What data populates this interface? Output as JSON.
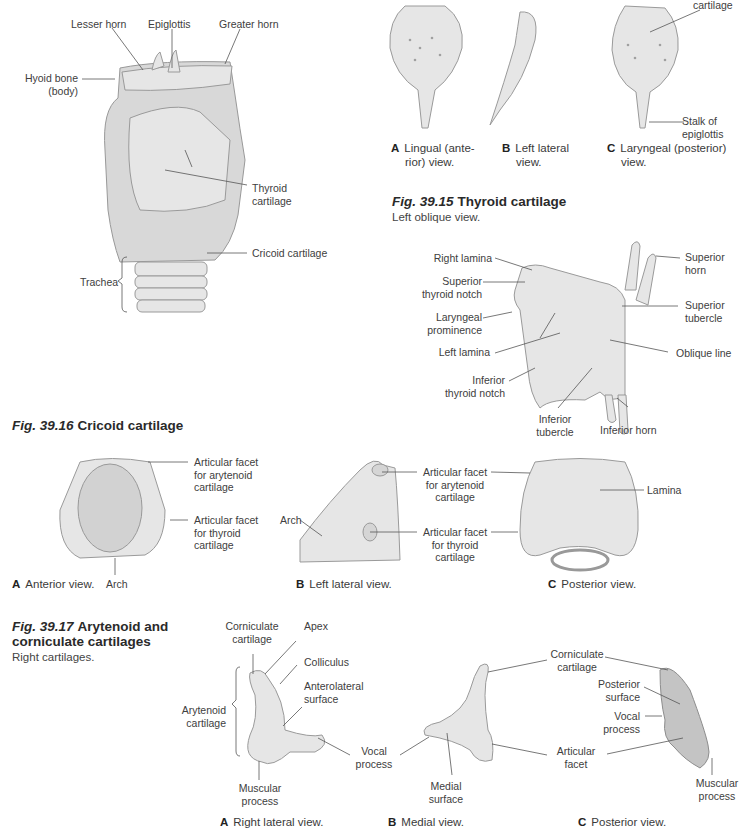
{
  "larynx_overview": {
    "labels": {
      "lesser_horn": "Lesser horn",
      "epiglottis": "Epiglottis",
      "greater_horn": "Greater horn",
      "hyoid_bone": [
        "Hyoid bone",
        "(body)"
      ],
      "thyroid_cartilage": [
        "Thyroid",
        "cartilage"
      ],
      "cricoid_cartilage": "Cricoid cartilage",
      "trachea": "Trachea"
    }
  },
  "epiglottis_views": {
    "label_cartilage": "cartilage",
    "label_stalk": [
      "Stalk of",
      "epiglottis"
    ],
    "captions": [
      {
        "letter": "A",
        "lines": [
          "Lingual (ante-",
          "rior)  view."
        ]
      },
      {
        "letter": "B",
        "lines": [
          "Left lateral",
          "view."
        ]
      },
      {
        "letter": "C",
        "lines": [
          "Laryngeal (posterior)",
          "view."
        ]
      }
    ]
  },
  "fig_39_15": {
    "number": "Fig. 39.15",
    "title": "Thyroid cartilage",
    "subtitle": "Left oblique view.",
    "labels": {
      "right_lamina": "Right lamina",
      "superior_thyroid_notch": [
        "Superior",
        "thyroid notch"
      ],
      "laryngeal_prominence": [
        "Laryngeal",
        "prominence"
      ],
      "left_lamina": "Left lamina",
      "inferior_thyroid_notch": [
        "Inferior",
        "thyroid notch"
      ],
      "inferior_tubercle": [
        "Inferior",
        "tubercle"
      ],
      "inferior_horn": "Inferior horn",
      "oblique_line": "Oblique line",
      "superior_tubercle": [
        "Superior",
        "tubercle"
      ],
      "superior_horn": [
        "Superior",
        "horn"
      ]
    }
  },
  "fig_39_16": {
    "number": "Fig. 39.16",
    "title": "Cricoid cartilage",
    "labels": {
      "facet_arytenoid": [
        "Articular facet",
        "for arytenoid",
        "cartilage"
      ],
      "facet_thyroid": [
        "Articular facet",
        "for thyroid",
        "cartilage"
      ],
      "arch": "Arch",
      "lamina": "Lamina"
    },
    "captions": [
      {
        "letter": "A",
        "text": "Anterior view."
      },
      {
        "letter": "B",
        "text": "Left lateral view."
      },
      {
        "letter": "C",
        "text": "Posterior view."
      }
    ]
  },
  "fig_39_17": {
    "number": "Fig. 39.17",
    "title_lines": [
      "Arytenoid and",
      "corniculate cartilages"
    ],
    "subtitle": "Right cartilages.",
    "labels": {
      "corniculate_cartilage": [
        "Corniculate",
        "cartilage"
      ],
      "apex": "Apex",
      "colliculus": "Colliculus",
      "anterolateral_surface": [
        "Anterolateral",
        "surface"
      ],
      "arytenoid_cartilage": [
        "Arytenoid",
        "cartilage"
      ],
      "vocal_process": [
        "Vocal",
        "process"
      ],
      "muscular_process": [
        "Muscular",
        "process"
      ],
      "medial_surface": [
        "Medial",
        "surface"
      ],
      "articular_facet": [
        "Articular",
        "facet"
      ],
      "posterior_surface": [
        "Posterior",
        "surface"
      ]
    },
    "captions": [
      {
        "letter": "A",
        "text": "Right lateral view."
      },
      {
        "letter": "B",
        "text": "Medial view."
      },
      {
        "letter": "C",
        "text": "Posterior view."
      }
    ]
  }
}
